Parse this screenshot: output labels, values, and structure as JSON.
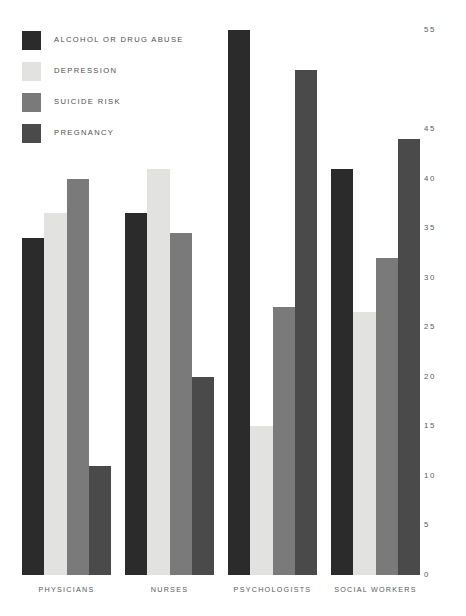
{
  "chart_data": {
    "type": "bar",
    "title": "",
    "subtitle": "",
    "xlabel": "",
    "ylabel": "",
    "ylim": [
      0,
      55
    ],
    "grid": false,
    "y_axis_position": "right",
    "legend_position": "top-left",
    "y_ticks": [
      0,
      5,
      10,
      15,
      20,
      25,
      30,
      35,
      40,
      45,
      55
    ],
    "categories": [
      "PHYSICIANS",
      "NURSES",
      "PSYCHOLOGISTS",
      "SOCIAL WORKERS"
    ],
    "series": [
      {
        "name": "ALCOHOL OR DRUG ABUSE",
        "color": "#2b2b2b",
        "values": [
          34,
          36.5,
          55,
          41
        ]
      },
      {
        "name": "DEPRESSION",
        "color": "#e2e2e0",
        "values": [
          36.5,
          41,
          15,
          26.5
        ]
      },
      {
        "name": "SUICIDE RISK",
        "color": "#7a7a7a",
        "values": [
          40,
          34.5,
          27,
          32
        ]
      },
      {
        "name": "PREGNANCY",
        "color": "#4a4a4a",
        "values": [
          11,
          20,
          51,
          44
        ]
      }
    ]
  },
  "legend": {
    "items": [
      {
        "label": "ALCOHOL OR DRUG ABUSE",
        "color": "#2b2b2b"
      },
      {
        "label": "DEPRESSION",
        "color": "#e2e2e0"
      },
      {
        "label": "SUICIDE RISK",
        "color": "#7a7a7a"
      },
      {
        "label": "PREGNANCY",
        "color": "#4a4a4a"
      }
    ]
  }
}
